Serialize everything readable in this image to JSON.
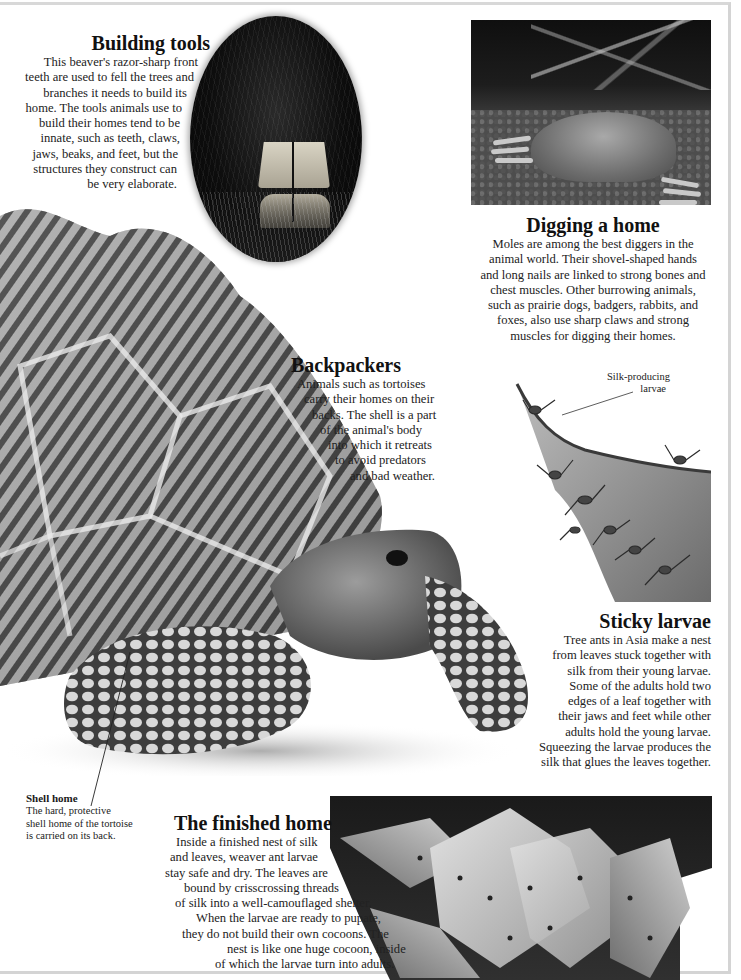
{
  "sections": {
    "building_tools": {
      "title": "Building tools",
      "lines": [
        "This beaver's razor-sharp front",
        "teeth are used to fell the trees and",
        "branches it needs to build its",
        "home. The tools animals use to",
        "build their homes tend to be",
        "innate, such as teeth, claws,",
        "jaws, beaks, and feet, but the",
        "structures they construct can",
        "be very elaborate."
      ]
    },
    "digging_a_home": {
      "title": "Digging a home",
      "lines": [
        "Moles are among the best diggers in the",
        "animal world. Their shovel-shaped hands",
        "and long nails are linked to strong bones and",
        "chest muscles. Other burrowing animals,",
        "such as prairie dogs, badgers, rabbits, and",
        "foxes, also use sharp claws and strong",
        "muscles for digging their homes."
      ]
    },
    "backpackers": {
      "title": "Backpackers",
      "lines": [
        "Animals such as tortoises",
        "carry their homes on their",
        "backs. The shell is a part",
        "of the animal's body",
        "into which it retreats",
        "to avoid predators",
        "and bad weather."
      ]
    },
    "sticky_larvae": {
      "title": "Sticky larvae",
      "lines": [
        "Tree ants in Asia make a nest",
        "from leaves stuck together with",
        "silk from their young larvae.",
        "Some of the adults hold two",
        "edges of a leaf together with",
        "their jaws and feet while other",
        "adults hold the young larvae.",
        "Squeezing the larvae produces the",
        "silk that glues the leaves together."
      ],
      "callout": [
        "Silk-producing",
        "larvae"
      ]
    },
    "shell_home": {
      "title": "Shell home",
      "lines": [
        "The hard, protective",
        "shell home of the tortoise",
        "is carried on its back."
      ]
    },
    "finished_home": {
      "title": "The finished home",
      "lines": [
        "Inside a finished nest of silk",
        "and leaves, weaver ant larvae",
        "stay safe and dry. The leaves are",
        "bound by crisscrossing threads",
        "of silk into a well-camouflaged shelter.",
        "When the larvae are ready to pupate,",
        "they do not build their own cocoons. The",
        "nest is like one huge cocoon, inside",
        "of which the larvae turn into adults."
      ]
    }
  },
  "images": {
    "beaver": "beaver-teeth-photo",
    "mole": "mole-digging-photo",
    "tortoise": "star-tortoise-photo",
    "ants": "weaver-ants-on-leaf-photo",
    "nest": "weaver-ant-nest-photo"
  },
  "colors": {
    "page_bg": "#ffffff",
    "text": "#1a1a1a",
    "frame": "#d6d6d6"
  }
}
